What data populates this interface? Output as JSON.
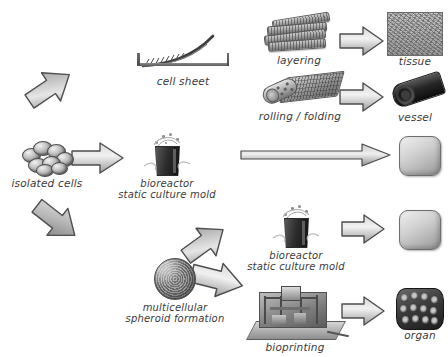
{
  "diagram": {
    "background": "#ffffff",
    "arrow_fill_light": "#e8e8e8",
    "arrow_fill_dark": "#9a9a9a",
    "arrow_stroke": "#4a4a4a"
  },
  "labels": {
    "isolated_cells": "isolated cells",
    "cell_sheet": "cell sheet",
    "bioreactor_top": "bioreactor\nstatic culture mold",
    "bioreactor_bottom": "bioreactor\nstatic culture mold",
    "spheroid": "multicellular\nspheroid formation",
    "layering": "layering",
    "rolling_folding": "rolling / folding",
    "bioprinting": "bioprinting",
    "tissue": "tissue",
    "vessel": "vessel",
    "organ": "organ"
  },
  "nodes": [
    {
      "id": "isolated-cells",
      "label": "isolated cells",
      "kind": "cell-cluster"
    },
    {
      "id": "cell-sheet",
      "label": "cell sheet",
      "kind": "culture-dish"
    },
    {
      "id": "bioreactor-top",
      "label": "bioreactor static culture mold",
      "kind": "bioreactor-flask"
    },
    {
      "id": "spheroid",
      "label": "multicellular spheroid formation",
      "kind": "spheroid"
    },
    {
      "id": "bioreactor-bottom",
      "label": "bioreactor static culture mold",
      "kind": "bioreactor-flask"
    },
    {
      "id": "layering",
      "label": "layering",
      "kind": "stacked-sheets"
    },
    {
      "id": "rolling-folding",
      "label": "rolling / folding",
      "kind": "rolled-sheet"
    },
    {
      "id": "bioprinting",
      "label": "bioprinting",
      "kind": "bioprinter"
    },
    {
      "id": "tissue",
      "label": "tissue",
      "kind": "tissue-swatch"
    },
    {
      "id": "vessel",
      "label": "vessel",
      "kind": "vessel-tube"
    },
    {
      "id": "construct-mid",
      "label": "",
      "kind": "construct-block"
    },
    {
      "id": "construct-lower",
      "label": "",
      "kind": "construct-block"
    },
    {
      "id": "organ",
      "label": "organ",
      "kind": "organ-scaffold"
    }
  ],
  "arrows": [
    {
      "id": "cells-to-sheet",
      "from": "isolated-cells",
      "to": "cell-sheet",
      "direction": "up-right"
    },
    {
      "id": "cells-to-bioreactor",
      "from": "isolated-cells",
      "to": "bioreactor-top",
      "direction": "right"
    },
    {
      "id": "cells-to-spheroid",
      "from": "isolated-cells",
      "to": "spheroid",
      "direction": "down-right"
    },
    {
      "id": "spheroid-to-bioreactor",
      "from": "spheroid",
      "to": "bioreactor-bottom",
      "direction": "up-right"
    },
    {
      "id": "spheroid-to-bioprinting",
      "from": "spheroid",
      "to": "bioprinting",
      "direction": "right"
    },
    {
      "id": "layering-to-tissue",
      "from": "layering",
      "to": "tissue",
      "direction": "right"
    },
    {
      "id": "rolling-to-vessel",
      "from": "rolling-folding",
      "to": "vessel",
      "direction": "right"
    },
    {
      "id": "bioreactor-to-construct",
      "from": "bioreactor-top",
      "to": "construct-mid",
      "direction": "right-long"
    },
    {
      "id": "bioreactor2-to-construct",
      "from": "bioreactor-bottom",
      "to": "construct-lower",
      "direction": "right"
    },
    {
      "id": "bioprinting-to-organ",
      "from": "bioprinting",
      "to": "organ",
      "direction": "right"
    }
  ]
}
